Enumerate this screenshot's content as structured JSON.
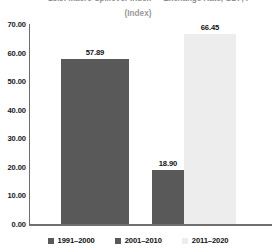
{
  "chart_data": {
    "type": "bar",
    "title": "15.9: Macro Spillover Index — Exchange Rate, GDP, I",
    "subtitle": "(Index)",
    "xlabel": "",
    "ylabel": "",
    "categories": [
      "1991–2000",
      "2001–2010",
      "2011–2020"
    ],
    "values": [
      57.89,
      18.9,
      66.45
    ],
    "value_labels": [
      "57.89",
      "18.90",
      "66.45"
    ],
    "ylim": [
      0,
      70
    ],
    "ytick_values": [
      0,
      10,
      20,
      30,
      40,
      50,
      60,
      70
    ],
    "ytick_labels": [
      "0.00",
      "10.00",
      "20.00",
      "30.00",
      "40.00",
      "50.00",
      "60.00",
      "70.00"
    ],
    "grid": false,
    "legend_position": "bottom",
    "series_colors": [
      "#595959",
      "#595959",
      "#ededed"
    ],
    "legend": [
      {
        "label": "1991–2000",
        "color": "#595959"
      },
      {
        "label": "2001–2010",
        "color": "#595959"
      },
      {
        "label": "2011–2020",
        "color": "#ededed"
      }
    ],
    "axis_color": "#6e6e6e",
    "background": "#ffffff"
  }
}
